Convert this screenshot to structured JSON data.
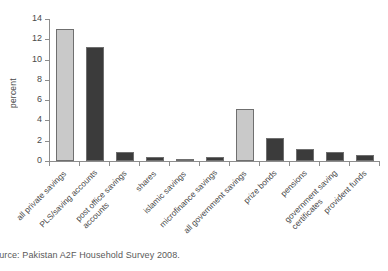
{
  "chart_data": {
    "type": "bar",
    "title": "",
    "subtitle": "",
    "xlabel": "",
    "ylabel": "percent",
    "ylim": [
      0,
      14
    ],
    "yticks": [
      0,
      2,
      4,
      6,
      8,
      10,
      12,
      14
    ],
    "ytick_labels": [
      "0",
      "2",
      "4",
      "6",
      "8",
      "10",
      "12",
      "14"
    ],
    "grid": false,
    "legend": null,
    "categories": [
      "all private savings",
      "PLS/saving accounts",
      "post office savings accounts",
      "shares",
      "islamic savings",
      "microfinance savings",
      "all government savings",
      "prize bonds",
      "pensions",
      "government saving certificates",
      "provident funds"
    ],
    "category_lines": [
      [
        "all private savings"
      ],
      [
        "PLS/saving accounts"
      ],
      [
        "post office savings",
        "accounts"
      ],
      [
        "shares"
      ],
      [
        "islamic savings"
      ],
      [
        "microfinance savings"
      ],
      [
        "all government savings"
      ],
      [
        "prize bonds"
      ],
      [
        "pensions"
      ],
      [
        "government saving",
        "certificates"
      ],
      [
        "provident funds"
      ]
    ],
    "values": [
      13.0,
      11.2,
      0.9,
      0.4,
      0.15,
      0.35,
      5.1,
      2.3,
      1.2,
      0.9,
      0.6
    ],
    "bar_colors": [
      "#c9c9c9",
      "#3b3b3b",
      "#3b3b3b",
      "#3b3b3b",
      "#3b3b3b",
      "#3b3b3b",
      "#c9c9c9",
      "#3b3b3b",
      "#3b3b3b",
      "#3b3b3b",
      "#3b3b3b"
    ],
    "bar_edge_color": "#6f6f6f",
    "aggregate_color": "#c9c9c9",
    "component_color": "#3b3b3b"
  },
  "source_note": "Source: Pakistan A2F Household Survey 2008.",
  "colors": {
    "background": "#ffffff",
    "axis": "#8d8d8d",
    "text": "#4a4a4a"
  }
}
